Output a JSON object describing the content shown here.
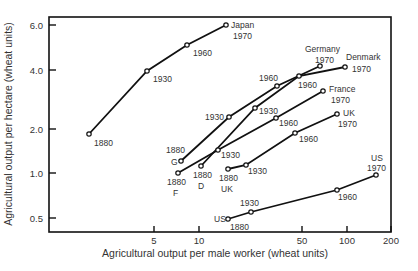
{
  "chart_data": {
    "type": "line",
    "title": "",
    "xlabel": "Agricultural output per male worker (wheat units)",
    "ylabel": "Agricultural output per hectare (wheat units)",
    "xscale": "log",
    "yscale": "log",
    "xlim": [
      1,
      200
    ],
    "ylim": [
      0.42,
      6.5
    ],
    "x_ticks": [
      5,
      10,
      50,
      100,
      200
    ],
    "y_ticks": [
      "0.5",
      "1.0",
      "2.0",
      "4.0",
      "6.0"
    ],
    "grid": false,
    "legend": "none (series labeled directly at endpoints)",
    "series": [
      {
        "name": "Japan",
        "start_label": "",
        "end_label": "Japan",
        "points": [
          {
            "year": "1880",
            "x": 1.8,
            "y": 1.9
          },
          {
            "year": "1930",
            "x": 4.5,
            "y": 4.0
          },
          {
            "year": "1960",
            "x": 8.3,
            "y": 5.0
          },
          {
            "year": "1970",
            "x": 15,
            "y": 6.0
          }
        ]
      },
      {
        "name": "Germany",
        "start_label": "G",
        "end_label": "Germany",
        "points": [
          {
            "year": "1880",
            "x": 7.6,
            "y": 1.2
          },
          {
            "year": "1930",
            "x": 16,
            "y": 2.3
          },
          {
            "year": "1960",
            "x": 34,
            "y": 3.4
          },
          {
            "year": "1970",
            "x": 66,
            "y": 4.1
          }
        ]
      },
      {
        "name": "Denmark",
        "start_label": "D",
        "end_label": "Denmark",
        "points": [
          {
            "year": "1880",
            "x": 10.3,
            "y": 1.1
          },
          {
            "year": "1930",
            "x": 24,
            "y": 2.6
          },
          {
            "year": "1960",
            "x": 47,
            "y": 3.8
          },
          {
            "year": "1970",
            "x": 97,
            "y": 4.1
          }
        ]
      },
      {
        "name": "France",
        "start_label": "F",
        "end_label": "France",
        "points": [
          {
            "year": "1880",
            "x": 7.2,
            "y": 1.0
          },
          {
            "year": "1930",
            "x": 13,
            "y": 1.4
          },
          {
            "year": "1960",
            "x": 33,
            "y": 2.3
          },
          {
            "year": "1970",
            "x": 69,
            "y": 3.1
          }
        ]
      },
      {
        "name": "UK",
        "start_label": "UK",
        "end_label": "UK",
        "points": [
          {
            "year": "1880",
            "x": 16,
            "y": 1.05
          },
          {
            "year": "1930",
            "x": 21,
            "y": 1.1
          },
          {
            "year": "1960",
            "x": 45,
            "y": 1.9
          },
          {
            "year": "1970",
            "x": 86,
            "y": 2.5
          }
        ]
      },
      {
        "name": "US",
        "start_label": "US",
        "end_label": "US",
        "points": [
          {
            "year": "1880",
            "x": 16,
            "y": 0.5
          },
          {
            "year": "1930",
            "x": 22,
            "y": 0.55
          },
          {
            "year": "1960",
            "x": 86,
            "y": 0.8
          },
          {
            "year": "1970",
            "x": 157,
            "y": 1.0
          }
        ]
      }
    ]
  },
  "render": {
    "plot": {
      "left": 49,
      "top": 17,
      "right": 391,
      "bottom": 232
    },
    "x_ticks_px": [
      {
        "label": "5",
        "x": 154
      },
      {
        "label": "10",
        "x": 199
      },
      {
        "label": "50",
        "x": 302
      },
      {
        "label": "100",
        "x": 347
      },
      {
        "label": "200",
        "x": 391
      }
    ],
    "y_ticks_px": [
      {
        "label": "6.0",
        "y": 25
      },
      {
        "label": "4.0",
        "y": 70
      },
      {
        "label": "2.0",
        "y": 129
      },
      {
        "label": "1.0",
        "y": 173
      },
      {
        "label": "0.5",
        "y": 218
      }
    ],
    "series_px": [
      {
        "name": "Japan",
        "pts": [
          [
            89,
            134
          ],
          [
            147,
            71
          ],
          [
            187,
            45
          ],
          [
            226,
            25
          ]
        ],
        "labels": [
          {
            "t": "1880",
            "x": 94,
            "y": 146
          },
          {
            "t": "1930",
            "x": 153,
            "y": 82
          },
          {
            "t": "1960",
            "x": 193,
            "y": 56
          },
          {
            "t": "Japan",
            "x": 231,
            "y": 28
          },
          {
            "t": "1970",
            "x": 233,
            "y": 39
          }
        ]
      },
      {
        "name": "Germany",
        "pts": [
          [
            181,
            161
          ],
          [
            229,
            117
          ],
          [
            277,
            86
          ],
          [
            320,
            66
          ]
        ],
        "labels": [
          {
            "t": "1880",
            "x": 166,
            "y": 153
          },
          {
            "t": "G",
            "x": 171,
            "y": 165
          },
          {
            "t": "1930",
            "x": 205,
            "y": 120
          },
          {
            "t": "1960",
            "x": 259,
            "y": 81
          },
          {
            "t": "Germany",
            "x": 305,
            "y": 52
          },
          {
            "t": "1970",
            "x": 315,
            "y": 63
          }
        ]
      },
      {
        "name": "Denmark",
        "pts": [
          [
            201,
            166
          ],
          [
            255,
            108
          ],
          [
            299,
            76
          ],
          [
            345,
            67
          ]
        ],
        "labels": [
          {
            "t": "1880",
            "x": 193,
            "y": 178
          },
          {
            "t": "D",
            "x": 198,
            "y": 189
          },
          {
            "t": "1930",
            "x": 259,
            "y": 114
          },
          {
            "t": "1960",
            "x": 298,
            "y": 88
          },
          {
            "t": "Denmark",
            "x": 346,
            "y": 60
          },
          {
            "t": "1970",
            "x": 352,
            "y": 72
          }
        ]
      },
      {
        "name": "France",
        "pts": [
          [
            178,
            173
          ],
          [
            218,
            150
          ],
          [
            276,
            118
          ],
          [
            323,
            91
          ]
        ],
        "labels": [
          {
            "t": "1880",
            "x": 167,
            "y": 185
          },
          {
            "t": "F",
            "x": 173,
            "y": 196
          },
          {
            "t": "1930",
            "x": 221,
            "y": 158
          },
          {
            "t": "1960",
            "x": 279,
            "y": 126
          },
          {
            "t": "France",
            "x": 329,
            "y": 92
          },
          {
            "t": "1970",
            "x": 331,
            "y": 103
          }
        ]
      },
      {
        "name": "UK",
        "pts": [
          [
            228,
            169
          ],
          [
            246,
            165
          ],
          [
            295,
            133
          ],
          [
            337,
            114
          ]
        ],
        "labels": [
          {
            "t": "1880",
            "x": 219,
            "y": 181
          },
          {
            "t": "UK",
            "x": 221,
            "y": 192
          },
          {
            "t": "1930",
            "x": 248,
            "y": 174
          },
          {
            "t": "1960",
            "x": 299,
            "y": 142
          },
          {
            "t": "UK",
            "x": 343,
            "y": 116
          },
          {
            "t": "1970",
            "x": 338,
            "y": 127
          }
        ]
      },
      {
        "name": "US",
        "pts": [
          [
            228,
            219
          ],
          [
            251,
            212
          ],
          [
            337,
            190
          ],
          [
            376,
            175
          ]
        ],
        "labels": [
          {
            "t": "US",
            "x": 214,
            "y": 222
          },
          {
            "t": "1880",
            "x": 230,
            "y": 230
          },
          {
            "t": "1930",
            "x": 240,
            "y": 206
          },
          {
            "t": "1960",
            "x": 338,
            "y": 200
          },
          {
            "t": "US",
            "x": 371,
            "y": 161
          },
          {
            "t": "1970",
            "x": 367,
            "y": 171
          }
        ]
      }
    ]
  }
}
